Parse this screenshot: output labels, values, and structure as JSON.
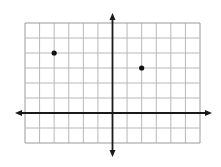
{
  "diagram": {
    "type": "coordinate-plane",
    "grid": {
      "x_min": -6,
      "x_max": 6,
      "y_min": -2,
      "y_max": 6,
      "columns": 12,
      "rows": 8,
      "left_px": 25,
      "top_px": 23,
      "right_px": 200,
      "bottom_px": 143,
      "line_color": "#b8b8b8",
      "border_color": "#9a9a9a"
    },
    "axes": {
      "color": "#1a1a1a",
      "x_axis": {
        "y_value": 0,
        "arrow_left_px": 15,
        "arrow_right_px": 212
      },
      "y_axis": {
        "x_value": 0,
        "arrow_top_px": 13,
        "arrow_bottom_px": 157
      }
    },
    "points": [
      {
        "label": "point-a",
        "x": -4,
        "y": 4,
        "color": "#111111"
      },
      {
        "label": "point-b",
        "x": 2,
        "y": 3,
        "color": "#111111"
      }
    ]
  }
}
